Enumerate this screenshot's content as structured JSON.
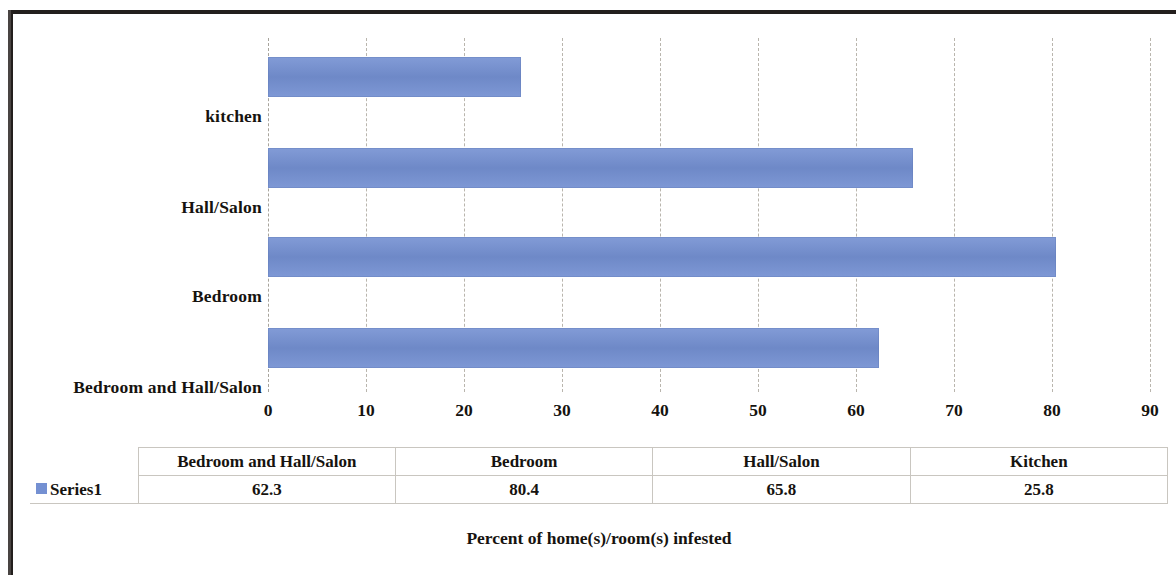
{
  "chart_data": {
    "type": "bar",
    "orientation": "horizontal",
    "title": "",
    "xlabel": "Percent of home(s)/room(s) infested",
    "ylabel": "",
    "xlim": [
      0,
      90
    ],
    "xticks": [
      0,
      10,
      20,
      30,
      40,
      50,
      60,
      70,
      80,
      90
    ],
    "xtick_labels": [
      "0",
      "10",
      "20",
      "30",
      "40",
      "50",
      "60",
      "70",
      "80",
      "90"
    ],
    "grid": true,
    "grid_axis": "x",
    "grid_style": "dashed",
    "legend_position": "bottom-table",
    "bar_color": "#7490d2",
    "categories_axis": [
      "kitchen",
      "Hall/Salon",
      "Bedroom",
      "Bedroom and Hall/Salon"
    ],
    "categories": [
      "Bedroom and Hall/Salon",
      "Bedroom",
      "Hall/Salon",
      "Kitchen"
    ],
    "series": [
      {
        "name": "Series1",
        "values": [
          62.3,
          80.4,
          65.8,
          25.8
        ]
      }
    ],
    "bars": [
      {
        "label": "kitchen",
        "value": 25.8
      },
      {
        "label": "Hall/Salon",
        "value": 65.8
      },
      {
        "label": "Bedroom",
        "value": 80.4
      },
      {
        "label": "Bedroom and Hall/Salon",
        "value": 62.3
      }
    ]
  },
  "data_table": {
    "legend_label": "Series1",
    "headers": [
      "Bedroom and Hall/Salon",
      "Bedroom",
      "Hall/Salon",
      "Kitchen"
    ],
    "values": [
      "62.3",
      "80.4",
      "65.8",
      "25.8"
    ]
  },
  "axis_title": "Percent of home(s)/room(s) infested"
}
